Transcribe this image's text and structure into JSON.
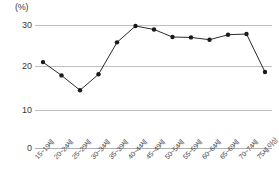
{
  "chart_data": {
    "type": "line",
    "title": "",
    "xlabel": "",
    "ylabel": "(%)",
    "unit_label": "(%)",
    "ylim": [
      0,
      35
    ],
    "yticks": [
      0,
      10,
      20,
      30
    ],
    "grid": true,
    "legend": "none",
    "categories": [
      "15~19세",
      "20~24세",
      "25~29세",
      "30~34세",
      "35~39세",
      "40~44세",
      "45~49세",
      "50~54세",
      "55~59세",
      "60~64세",
      "65~69세",
      "70~74세",
      "75세 이상"
    ],
    "values": [
      22.6,
      19.1,
      15.2,
      19.4,
      27.8,
      32.1,
      31.2,
      29.2,
      29.1,
      28.5,
      29.8,
      30.0,
      20.0
    ],
    "series": [
      {
        "name": "",
        "values": [
          22.6,
          19.1,
          15.2,
          19.4,
          27.8,
          32.1,
          31.2,
          29.2,
          29.1,
          28.5,
          29.8,
          30.0,
          20.0
        ],
        "color": "#2b2b2b",
        "marker": "circle"
      }
    ]
  },
  "colors": {
    "line": "#2b2b2b",
    "marker": "#1a1a1a",
    "grid": "#bfbfbf",
    "text": "#3a3a3a",
    "background": "#ffffff"
  }
}
